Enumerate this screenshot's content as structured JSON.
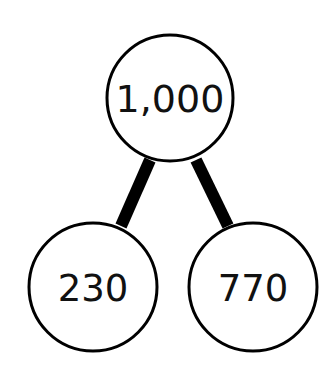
{
  "diagram": {
    "type": "number-bond",
    "colors": {
      "stroke": "#000000",
      "fill": "#ffffff",
      "text": "#111111"
    },
    "whole": {
      "label": "1,000",
      "cx": 170,
      "cy": 98,
      "r": 63
    },
    "parts": [
      {
        "label": "230",
        "cx": 93,
        "cy": 287,
        "r": 64
      },
      {
        "label": "770",
        "cx": 253,
        "cy": 287,
        "r": 64
      }
    ]
  }
}
